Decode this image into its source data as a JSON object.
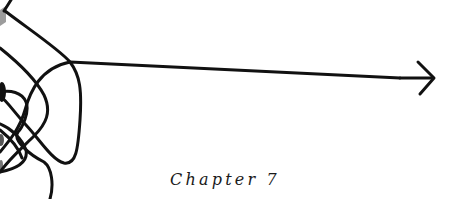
{
  "page": {
    "type": "chapter-opener",
    "chapter_label": "Chapter 7",
    "illustration": {
      "description": "tangled-line-resolving-into-arrow",
      "stroke_color": "#111111",
      "accent_gray": "#9a9a9a",
      "arrow_direction": "right"
    }
  }
}
